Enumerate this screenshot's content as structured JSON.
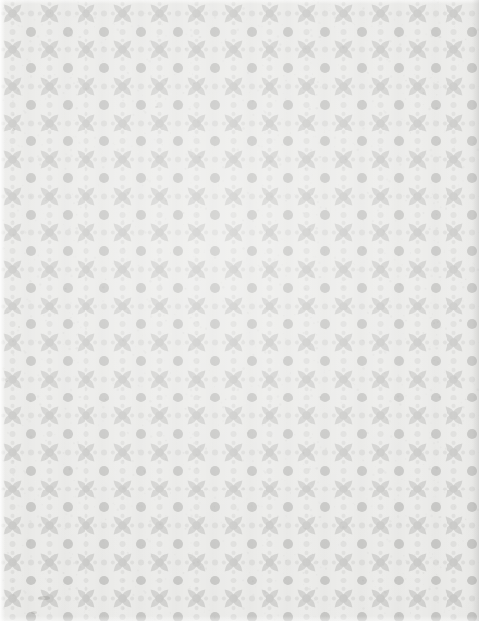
{
  "document": {
    "kind": "scanned-decorative-endpaper",
    "title": "Decorative endpaper",
    "width_px": 479,
    "height_px": 621,
    "has_text": false,
    "description": "Full-page repeating geometric floral lattice printed in pale grey on off-white paper"
  },
  "palette": {
    "paper": "#eaeae8",
    "paper_light": "#f2f2f0",
    "ink_light": "#dcdcda",
    "ink": "#cfcfcd",
    "ink_dark": "#c6c6c4",
    "edge_shadow": "#b9b9b7",
    "speck": "#8e8d88"
  },
  "pattern": {
    "name": "four-petal-lattice",
    "tile_width_px": 36.8,
    "tile_height_px": 36.6,
    "offset_x_px": -6,
    "offset_y_px": -5,
    "motifs": [
      {
        "name": "center-dot",
        "shape": "circle",
        "radius_px": 4.2
      },
      {
        "name": "petal-teardrop",
        "shape": "teardrop",
        "count": 4,
        "orientation": "diagonal-outward",
        "length_px": 12.5
      },
      {
        "name": "lattice-node-circle",
        "shape": "circle",
        "radius_px": 5.0
      },
      {
        "name": "midpoint-dot",
        "shape": "circle",
        "radius_px": 3.0
      }
    ],
    "repeats_across": 13,
    "repeats_down": 17
  },
  "marks": [
    {
      "name": "ink-smudge",
      "x_px": 38,
      "y_px": 596,
      "width_px": 12,
      "height_px": 4,
      "opacity": 0.3
    },
    {
      "name": "foxing-speck",
      "x_px": 31,
      "y_px": 611,
      "width_px": 6,
      "height_px": 3,
      "opacity": 0.22
    },
    {
      "name": "foxing-speck",
      "x_px": 12,
      "y_px": 128,
      "width_px": 3,
      "height_px": 3,
      "opacity": 0.18
    },
    {
      "name": "foxing-speck",
      "x_px": 155,
      "y_px": 106,
      "width_px": 3,
      "height_px": 2,
      "opacity": 0.16
    },
    {
      "name": "foxing-speck",
      "x_px": 5,
      "y_px": 378,
      "width_px": 3,
      "height_px": 4,
      "opacity": 0.2
    },
    {
      "name": "foxing-speck",
      "x_px": 459,
      "y_px": 319,
      "width_px": 3,
      "height_px": 3,
      "opacity": 0.17
    },
    {
      "name": "foxing-speck",
      "x_px": 18,
      "y_px": 326,
      "width_px": 2,
      "height_px": 2,
      "opacity": 0.15
    }
  ]
}
